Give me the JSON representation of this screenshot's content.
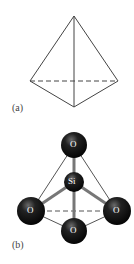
{
  "figure_a": {
    "label": "(a)",
    "shape": "tetrahedron-outline",
    "line_color": "#444444",
    "hidden_edge_style": "dashed"
  },
  "figure_b": {
    "label": "(b)",
    "center_atom": {
      "symbol": "Si"
    },
    "outer_atoms": [
      {
        "symbol": "O",
        "position": "top"
      },
      {
        "symbol": "O",
        "position": "left"
      },
      {
        "symbol": "O",
        "position": "right"
      },
      {
        "symbol": "O",
        "position": "bottom"
      }
    ],
    "atom_color": "#111111",
    "text_color": "#ffffff"
  }
}
